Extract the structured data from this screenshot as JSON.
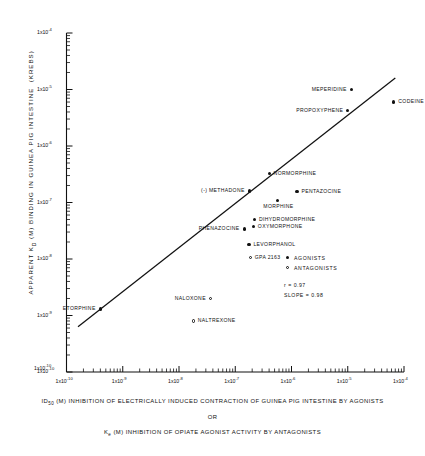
{
  "chart_data": {
    "type": "scatter",
    "title": "",
    "xlabel_primary": "ID50 (M) INHIBITION OF ELECTRICALLY INDUCED CONTRACTION OF GUINEA PIG INTESTINE BY AGONISTS",
    "xlabel_or": "OR",
    "xlabel_secondary": "Ke (M) INHIBITION OF OPIATE AGONIST ACTIVITY BY ANTAGONISTS",
    "ylabel": "APPARENT KD (M) BINDING IN GUINEA PIG INTESTINE (KREBS)",
    "xscale": "log",
    "yscale": "log",
    "xlim": [
      1e-10,
      0.0001
    ],
    "ylim": [
      1e-10,
      0.0001
    ],
    "grid": false,
    "legend_position": "center-right",
    "x_tick_labels": [
      {
        "mant": "1x10",
        "exp": "-10"
      },
      {
        "mant": "1x10",
        "exp": "-9"
      },
      {
        "mant": "1x10",
        "exp": "-8"
      },
      {
        "mant": "1x10",
        "exp": "-7"
      },
      {
        "mant": "1x10",
        "exp": "-6"
      },
      {
        "mant": "1x10",
        "exp": "-5"
      },
      {
        "mant": "1x10",
        "exp": "-4"
      }
    ],
    "y_tick_labels": [
      {
        "mant": "1x10",
        "exp": "-4"
      },
      {
        "mant": "1x10",
        "exp": "-5"
      },
      {
        "mant": "1x10",
        "exp": "-6"
      },
      {
        "mant": "1x10",
        "exp": "-7"
      },
      {
        "mant": "1x10",
        "exp": "-8"
      },
      {
        "mant": "1x10",
        "exp": "-9"
      },
      {
        "mant": "1x10",
        "exp": "-10"
      }
    ],
    "y_corner_label": {
      "mant": "1x10",
      "exp": "-10"
    },
    "fit_line": {
      "slope": 0.98,
      "r": 0.97,
      "x_start": 1.6e-10,
      "y_start": 6.3e-10,
      "x_end": 7e-05,
      "y_end": 1.6e-05
    },
    "series": [
      {
        "name": "AGONISTS",
        "marker": "filled-circle",
        "points": [
          {
            "label": "MEPERIDINE",
            "x": 1.15e-05,
            "y": 1e-05,
            "label_side": "left"
          },
          {
            "label": "CODEINE",
            "x": 6.6e-05,
            "y": 6e-06,
            "label_side": "right"
          },
          {
            "label": "PROPOXYPHENE",
            "x": 1e-05,
            "y": 4.3e-06,
            "label_side": "left"
          },
          {
            "label": "NORMORPHINE",
            "x": 4e-07,
            "y": 3.3e-07,
            "label_side": "right"
          },
          {
            "label": "PENTAZOCINE",
            "x": 1.25e-06,
            "y": 1.55e-07,
            "label_side": "right"
          },
          {
            "label": "MORPHINE",
            "x": 5.6e-07,
            "y": 1.1e-07,
            "label_side": "below"
          },
          {
            "label": "(-) METHADONE",
            "x": 1.8e-07,
            "y": 1.6e-07,
            "label_side": "left"
          },
          {
            "label": "DIHYDROMORPHINE",
            "x": 2.2e-07,
            "y": 5e-08,
            "label_side": "right"
          },
          {
            "label": "OXYMORPHONE",
            "x": 2.1e-07,
            "y": 3.7e-08,
            "label_side": "right"
          },
          {
            "label": "PHENAZOCINE",
            "x": 1.45e-07,
            "y": 3.4e-08,
            "label_side": "left"
          },
          {
            "label": "LEVORPHANOL",
            "x": 1.75e-07,
            "y": 1.8e-08,
            "label_side": "right"
          },
          {
            "label": "ETORPHINE",
            "x": 4e-10,
            "y": 1.3e-09,
            "label_side": "left"
          }
        ]
      },
      {
        "name": "ANTAGONISTS",
        "marker": "open-circle",
        "points": [
          {
            "label": "GPA 2163",
            "x": 1.85e-07,
            "y": 1.05e-08,
            "label_side": "right"
          },
          {
            "label": "NALOXONE",
            "x": 3.6e-08,
            "y": 2e-09,
            "label_side": "left"
          },
          {
            "label": "NALTREXONE",
            "x": 1.8e-08,
            "y": 8e-10,
            "label_side": "right"
          }
        ]
      }
    ],
    "legend": [
      {
        "marker": "filled-circle",
        "label": "AGONISTS"
      },
      {
        "marker": "open-circle",
        "label": "ANTAGONISTS"
      }
    ],
    "stats": [
      {
        "label": "r = 0.97"
      },
      {
        "label": "SLOPE = 0.98"
      }
    ]
  }
}
